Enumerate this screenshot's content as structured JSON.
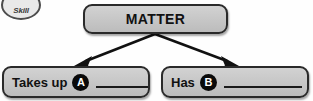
{
  "page": {
    "background_color": "#fefefe"
  },
  "badge": {
    "label": "Skill",
    "shape": "ellipse",
    "fill_color": "#e9e9e9",
    "border_color": "#4c4c4c"
  },
  "diagram": {
    "type": "concept-map",
    "node_fill_color": "#c8c8c8",
    "node_border_color": "#2a2a2a",
    "arrow_color": "#111111",
    "root": {
      "title": "MATTER"
    },
    "branches": [
      {
        "label": "Takes up",
        "marker": "A",
        "blank": "",
        "blank_width_px": 62
      },
      {
        "label": "Has",
        "marker": "B",
        "blank": "",
        "blank_width_px": 78
      }
    ],
    "arrows": [
      {
        "name": "arrow-to-takes-up",
        "from": [
          155,
          34
        ],
        "to": [
          78,
          65
        ]
      },
      {
        "name": "arrow-to-has",
        "from": [
          155,
          34
        ],
        "to": [
          235,
          65
        ]
      }
    ]
  }
}
